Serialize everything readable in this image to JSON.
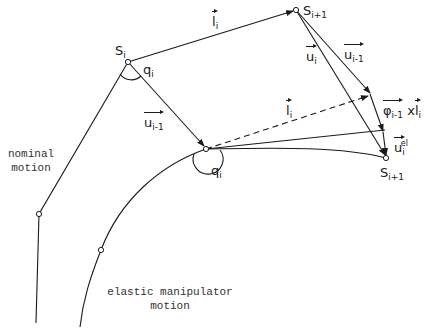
{
  "diagram": {
    "points": {
      "s_i": {
        "label": "S",
        "sub": "i"
      },
      "s_i1_top": {
        "label": "S",
        "sub": "i+1"
      },
      "s_i1_bottom": {
        "label": "S",
        "sub": "i+1"
      },
      "q_i_top": {
        "label": "q",
        "sub": "i"
      },
      "q_i_bottom": {
        "label": "q",
        "sub": "i"
      }
    },
    "vectors": {
      "l_i_top": {
        "label": "l",
        "sub": "i"
      },
      "l_i_dashed": {
        "label": "l",
        "sub": "i"
      },
      "u_i": {
        "label": "u",
        "sub": "i"
      },
      "u_i_minus_1_top": {
        "label": "u",
        "sub": "i-1"
      },
      "u_i_minus_1_left": {
        "label": "u",
        "sub": "i-1"
      },
      "phi": {
        "label": "φ",
        "sub": "i-1",
        "suffix": "x",
        "suffix_vec": "l",
        "suffix_sub": "i"
      },
      "u_el": {
        "label": "u",
        "sub": "i",
        "sup": "el"
      }
    },
    "captions": {
      "nominal_line1": "nominal",
      "nominal_line2": "motion",
      "elastic_line1": "elastic manipulator",
      "elastic_line2": "motion"
    }
  }
}
